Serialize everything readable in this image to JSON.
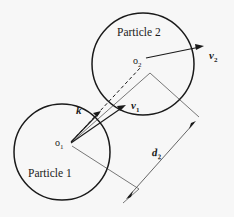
{
  "figure": {
    "background_color": "#f7f7f7",
    "ink_color": "#1a1a1a",
    "thin_line_color": "#555555",
    "width": 234,
    "height": 217,
    "particles": [
      {
        "id": "particle-1",
        "label": "Particle 1",
        "center_label": "o",
        "center_subscript": "1",
        "cx": 62,
        "cy": 152,
        "r": 48
      },
      {
        "id": "particle-2",
        "label": "Particle 2",
        "center_label": "o",
        "center_subscript": "2",
        "cx": 143,
        "cy": 64,
        "r": 51
      }
    ],
    "vectors": [
      {
        "id": "vector-k",
        "label": "k",
        "subscript": "",
        "from_x": 71,
        "from_y": 142,
        "to_x": 100,
        "to_y": 112
      },
      {
        "id": "vector-v1",
        "label": "v",
        "subscript": "1",
        "from_x": 71,
        "from_y": 143,
        "to_x": 125,
        "to_y": 106
      },
      {
        "id": "vector-v2",
        "label": "v",
        "subscript": "2",
        "from_x": 146,
        "from_y": 58,
        "to_x": 203,
        "to_y": 46
      }
    ],
    "center_line": {
      "id": "center-to-center-dashed-line",
      "from_x": 72,
      "from_y": 141,
      "to_x": 141,
      "to_y": 67,
      "style": "dashed"
    },
    "dimension": {
      "id": "distance-d2",
      "label": "d",
      "subscript": "2",
      "from_x": 128,
      "from_y": 197,
      "to_x": 194,
      "to_y": 123,
      "arrowheads": "both"
    },
    "construction_lines": [
      {
        "id": "extension-line-from-o1-upper",
        "from_x": 72,
        "from_y": 142,
        "to_x": 150,
        "to_y": 73
      },
      {
        "id": "extension-line-from-o1-lower",
        "from_x": 72,
        "from_y": 146,
        "to_x": 139,
        "to_y": 189
      },
      {
        "id": "extension-line-right-upper",
        "from_x": 150,
        "from_y": 73,
        "to_x": 199,
        "to_y": 117
      },
      {
        "id": "extension-line-right-lower",
        "from_x": 139,
        "from_y": 189,
        "to_x": 123,
        "to_y": 203
      }
    ]
  }
}
